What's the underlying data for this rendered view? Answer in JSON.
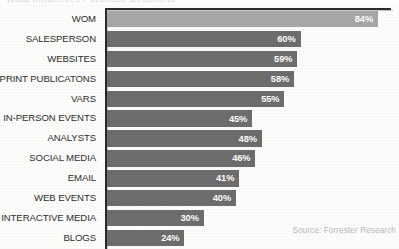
{
  "chart_data": {
    "type": "bar",
    "orientation": "horizontal",
    "title": "What Influences Purchase Decisions",
    "categories": [
      "WOM",
      "SALESPERSON",
      "WEBSITES",
      "PRINT PUBLICATONS",
      "VARS",
      "IN-PERSON EVENTS",
      "ANALYSTS",
      "SOCIAL MEDIA",
      "EMAIL",
      "WEB EVENTS",
      "INTERACTIVE MEDIA",
      "BLOGS"
    ],
    "values": [
      84,
      60,
      59,
      58,
      55,
      45,
      48,
      46,
      41,
      40,
      30,
      24
    ],
    "value_labels": [
      "84%",
      "60%",
      "59%",
      "58%",
      "55%",
      "45%",
      "48%",
      "46%",
      "41%",
      "40%",
      "30%",
      "24%"
    ],
    "xlabel": "",
    "ylabel": "",
    "xlim": [
      0,
      84
    ],
    "grid": false,
    "legend": false,
    "highlight_index": 0,
    "colors": {
      "bar": "#6e6e6e",
      "bar_highlight": "#a8a8a8",
      "value_text": "#ffffff",
      "label_text": "#2e2e2e",
      "axis": "#2c2c2c",
      "source_text": "#b9b9b9",
      "background": "#fdfdfc"
    },
    "annotations": {
      "source": "Source: Forrester Research"
    }
  }
}
